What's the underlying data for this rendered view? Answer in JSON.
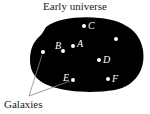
{
  "title": "Early universe",
  "caption": "Galaxies",
  "colors": {
    "universe": "#000000",
    "galaxy": "#ffffff",
    "text": "#222222"
  },
  "galaxies": [
    {
      "label": "C",
      "x": 84,
      "y": 26
    },
    {
      "label": "",
      "x": 116,
      "y": 39
    },
    {
      "label": "A",
      "x": 73,
      "y": 46
    },
    {
      "label": "B",
      "x": 63,
      "y": 51
    },
    {
      "label": "",
      "x": 43,
      "y": 52
    },
    {
      "label": "D",
      "x": 99,
      "y": 60
    },
    {
      "label": "E",
      "x": 73,
      "y": 80
    },
    {
      "label": "F",
      "x": 108,
      "y": 79
    }
  ]
}
